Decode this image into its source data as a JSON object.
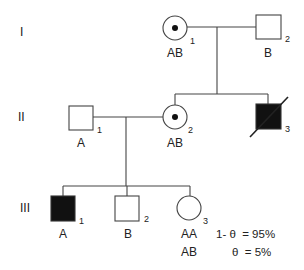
{
  "diagram": {
    "type": "pedigree",
    "colors": {
      "line": "#444444",
      "affected_fill": "#111111",
      "background": "#ffffff"
    },
    "generations": [
      {
        "label": "I",
        "y": 32
      },
      {
        "label": "II",
        "y": 121
      },
      {
        "label": "III",
        "y": 212
      }
    ],
    "individuals": {
      "I1": {
        "sex": "female",
        "status": "carrier",
        "number": "1",
        "genotype": "AB"
      },
      "I2": {
        "sex": "male",
        "status": "unaffected",
        "number": "2",
        "genotype": "B"
      },
      "II1": {
        "sex": "male",
        "status": "unaffected",
        "number": "1",
        "genotype": "A"
      },
      "II2": {
        "sex": "female",
        "status": "carrier",
        "number": "2",
        "genotype": "AB"
      },
      "II3": {
        "sex": "male",
        "status": "affected-deceased",
        "number": "3",
        "genotype": ""
      },
      "III1": {
        "sex": "male",
        "status": "affected",
        "number": "1",
        "genotype": "A"
      },
      "III2": {
        "sex": "male",
        "status": "unaffected",
        "number": "2",
        "genotype": "B"
      },
      "III3": {
        "sex": "female",
        "status": "unaffected",
        "number": "3",
        "genotype": "AA",
        "genotype_alt": "AB"
      }
    },
    "probabilities": [
      {
        "genotype": "AA",
        "expr": "1- θ  = 95%"
      },
      {
        "genotype": "AB",
        "expr": "θ  = 5%"
      }
    ]
  }
}
